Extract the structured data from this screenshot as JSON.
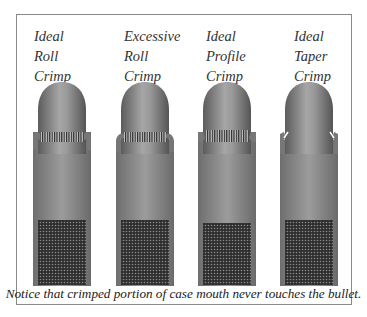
{
  "diagrams": [
    {
      "label": [
        "Ideal",
        "Roll",
        "Crimp"
      ],
      "type": "roll"
    },
    {
      "label": [
        "Excessive",
        "Roll",
        "Crimp"
      ],
      "type": "excessive-roll"
    },
    {
      "label": [
        "Ideal",
        "Profile",
        "Crimp"
      ],
      "type": "profile"
    },
    {
      "label": [
        "Ideal",
        "Taper",
        "Crimp"
      ],
      "type": "taper"
    }
  ],
  "caption": "Notice that crimped portion of case mouth never touches the bullet.",
  "colors": {
    "bullet_dark": "#5a5a5a",
    "bullet_light": "#a8a8a8",
    "case": "#8c8c8c",
    "powder": "#3a3a3a",
    "frame": "#8a8a8a"
  }
}
